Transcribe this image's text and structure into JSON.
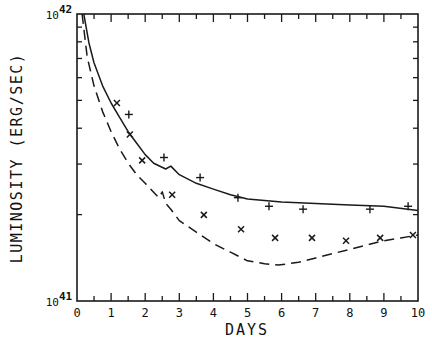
{
  "chart_data": {
    "type": "line",
    "title": "",
    "xlabel": "DAYS",
    "ylabel": "LUMINOSITY (ERG/SEC)",
    "xlim": [
      0,
      10
    ],
    "ylim": [
      1e+41,
      1e+42
    ],
    "yscale": "log",
    "x_ticks": [
      "0",
      "1",
      "2",
      "3",
      "4",
      "5",
      "6",
      "7",
      "8",
      "9",
      "10"
    ],
    "y_ticks": [
      {
        "base": "10",
        "exp": "41",
        "value": 1e+41
      },
      {
        "base": "10",
        "exp": "42",
        "value": 1e+42
      }
    ],
    "grid": false,
    "legend": null,
    "series": [
      {
        "name": "model (solid)",
        "style": "solid",
        "x": [
          0.2,
          0.35,
          0.5,
          0.75,
          1.0,
          1.25,
          1.5,
          1.75,
          2.0,
          2.25,
          2.6,
          2.75,
          3.0,
          3.5,
          4.0,
          4.5,
          5.0,
          6.0,
          7.0,
          8.0,
          9.0,
          10.0
        ],
        "logL": [
          42.0,
          41.9,
          41.83,
          41.75,
          41.69,
          41.64,
          41.59,
          41.55,
          41.51,
          41.48,
          41.46,
          41.47,
          41.44,
          41.41,
          41.39,
          41.37,
          41.355,
          41.345,
          41.34,
          41.335,
          41.33,
          41.315
        ]
      },
      {
        "name": "model (dashed)",
        "style": "dashed",
        "x": [
          0.15,
          0.3,
          0.5,
          0.75,
          1.0,
          1.25,
          1.5,
          1.75,
          2.0,
          2.4,
          2.5,
          2.6,
          2.75,
          3.0,
          3.5,
          4.0,
          4.5,
          5.0,
          5.5,
          5.9,
          6.5,
          7.0,
          7.5,
          8.0,
          8.5,
          9.0,
          9.5,
          10.0
        ],
        "logL": [
          42.0,
          41.85,
          41.75,
          41.66,
          41.59,
          41.53,
          41.48,
          41.44,
          41.41,
          41.36,
          41.38,
          41.34,
          41.32,
          41.28,
          41.24,
          41.2,
          41.17,
          41.14,
          41.13,
          41.125,
          41.135,
          41.15,
          41.165,
          41.18,
          41.195,
          41.21,
          41.22,
          41.23
        ]
      },
      {
        "name": "observations (+)",
        "style": "marker-plus",
        "x": [
          1.52,
          2.55,
          3.61,
          4.72,
          5.63,
          6.63,
          8.59,
          9.71
        ],
        "logL": [
          41.65,
          41.5,
          41.43,
          41.36,
          41.33,
          41.32,
          41.32,
          41.33
        ]
      },
      {
        "name": "observations (x)",
        "style": "marker-cross",
        "x": [
          1.17,
          1.55,
          1.91,
          2.79,
          3.72,
          4.81,
          5.81,
          6.89,
          7.89,
          8.89,
          9.85
        ],
        "logL": [
          41.69,
          41.58,
          41.49,
          41.37,
          41.3,
          41.25,
          41.22,
          41.22,
          41.21,
          41.22,
          41.23
        ]
      }
    ]
  }
}
